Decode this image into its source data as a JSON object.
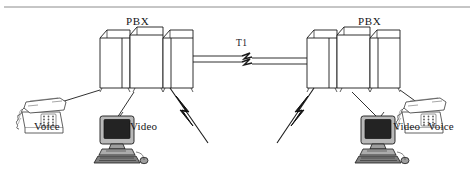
{
  "figure": {
    "type": "network-diagram",
    "background_color": "#ffffff",
    "line_color": "#1a1a1a",
    "device_fill": "#ffffff"
  },
  "rule": {
    "present": true,
    "color": "#8c8c8c"
  },
  "labels": {
    "pbx_left": "PBX",
    "pbx_right": "PBX",
    "trunk": "T1",
    "voice_left": "Voice",
    "video_left": "Video",
    "video_right": "Video",
    "voice_right": "Voice"
  },
  "nodes": [
    {
      "id": "pbx-left",
      "name": "PBX",
      "side": "left",
      "shape": "cabinet-3d"
    },
    {
      "id": "pbx-right",
      "name": "PBX",
      "side": "right",
      "shape": "cabinet-3d"
    },
    {
      "id": "phone-left",
      "name": "Voice",
      "side": "left",
      "shape": "desk-telephone"
    },
    {
      "id": "computer-left",
      "name": "Video",
      "side": "left",
      "shape": "desktop-computer"
    },
    {
      "id": "phone-right",
      "name": "Voice",
      "side": "right",
      "shape": "desk-telephone"
    },
    {
      "id": "computer-right",
      "name": "Video",
      "side": "right",
      "shape": "desktop-computer"
    }
  ],
  "links": [
    {
      "from": "pbx-left",
      "to": "pbx-right",
      "label": "T1",
      "style": "two-parallel-lines-with-break"
    },
    {
      "from": "pbx-left",
      "to": "phone-left",
      "label": "",
      "style": "plain-line"
    },
    {
      "from": "pbx-left",
      "to": "computer-left",
      "label": "",
      "style": "plain-line"
    },
    {
      "from": "pbx-left",
      "to": "wireless-left",
      "label": "",
      "style": "lightning-bolt"
    },
    {
      "from": "pbx-right",
      "to": "phone-right",
      "label": "",
      "style": "plain-line"
    },
    {
      "from": "pbx-right",
      "to": "computer-right",
      "label": "",
      "style": "plain-line"
    },
    {
      "from": "pbx-right",
      "to": "wireless-right",
      "label": "",
      "style": "lightning-bolt"
    }
  ]
}
